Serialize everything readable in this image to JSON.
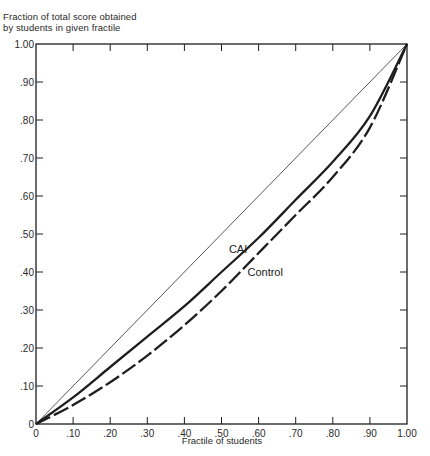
{
  "chart_data": {
    "type": "line",
    "title": "",
    "ylabel": "Fraction of total score obtained by students in given fractile",
    "ylabel_lines": [
      "Fraction of total score obtained",
      "by students in given fractile"
    ],
    "xlabel": "Fractile of students",
    "xlim": [
      0,
      1.0
    ],
    "ylim": [
      0,
      1.0
    ],
    "grid": false,
    "legend_position": "inline labels",
    "x_ticks": [
      "0",
      ".10",
      ".20",
      ".30",
      ".40",
      ".50",
      ".60",
      ".70",
      ".80",
      ".90",
      "1.00"
    ],
    "y_ticks": [
      "0",
      ".10",
      ".20",
      ".30",
      ".40",
      ".50",
      ".60",
      ".70",
      ".80",
      ".90",
      "1.00"
    ],
    "x": [
      0,
      0.1,
      0.2,
      0.3,
      0.4,
      0.5,
      0.6,
      0.7,
      0.8,
      0.9,
      1.0
    ],
    "series": [
      {
        "name": "Equality line",
        "style": "thin solid",
        "values": [
          0,
          0.1,
          0.2,
          0.3,
          0.4,
          0.5,
          0.6,
          0.7,
          0.8,
          0.9,
          1.0
        ]
      },
      {
        "name": "CAI",
        "style": "thick solid",
        "values": [
          0,
          0.07,
          0.15,
          0.23,
          0.31,
          0.4,
          0.49,
          0.59,
          0.69,
          0.81,
          1.0
        ]
      },
      {
        "name": "Control",
        "style": "thick dashed",
        "values": [
          0,
          0.05,
          0.11,
          0.18,
          0.26,
          0.35,
          0.45,
          0.55,
          0.65,
          0.78,
          1.0
        ]
      }
    ],
    "annotations": [
      {
        "text": "CAI",
        "x": 0.52,
        "y": 0.45
      },
      {
        "text": "Control",
        "x": 0.57,
        "y": 0.39
      }
    ]
  },
  "colors": {
    "ink": "#1e1e1e",
    "thin_line": "#444444",
    "background": "#ffffff"
  }
}
